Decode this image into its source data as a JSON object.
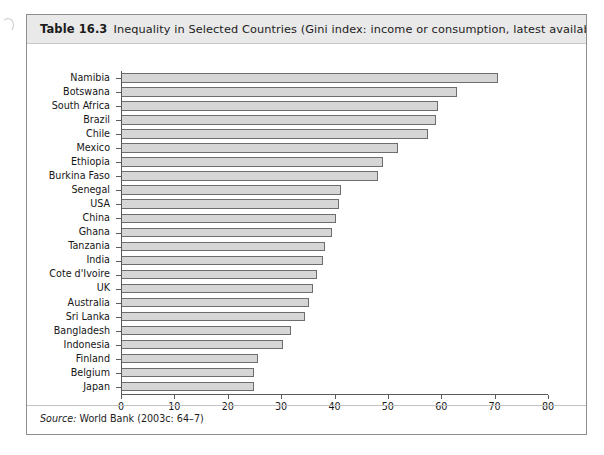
{
  "caption": {
    "label": "Table 16.3",
    "text": "Inequality in Selected Countries (Gini index: income or consumption, latest available year"
  },
  "source": {
    "prefix": "Source:",
    "text": "World Bank (2003c: 64–7)"
  },
  "colors": {
    "bar_fill": "#d6d6d6",
    "bar_border": "#6d6d6d",
    "axis": "#5a5a5a",
    "caption_bg": "#e9e9e9",
    "frame": "#8e8e8e"
  },
  "chart_data": {
    "type": "bar",
    "orientation": "horizontal",
    "title": "Inequality in Selected Countries (Gini index: income or consumption, latest available year",
    "xlabel": "",
    "ylabel": "",
    "xlim": [
      0,
      80
    ],
    "xticks": [
      0,
      10,
      20,
      30,
      40,
      50,
      60,
      70,
      80
    ],
    "grid": false,
    "legend": null,
    "categories": [
      "Namibia",
      "Botswana",
      "South Africa",
      "Brazil",
      "Chile",
      "Mexico",
      "Ethiopia",
      "Burkina Faso",
      "Senegal",
      "USA",
      "China",
      "Ghana",
      "Tanzania",
      "India",
      "Cote d'Ivoire",
      "UK",
      "Australia",
      "Sri Lanka",
      "Bangladesh",
      "Indonesia",
      "Finland",
      "Belgium",
      "Japan"
    ],
    "values": [
      70.7,
      63.0,
      59.3,
      59.1,
      57.5,
      51.9,
      49.0,
      48.2,
      41.3,
      40.8,
      40.3,
      39.6,
      38.2,
      37.8,
      36.7,
      36.0,
      35.2,
      34.4,
      31.8,
      30.3,
      25.6,
      25.0,
      24.9
    ]
  }
}
